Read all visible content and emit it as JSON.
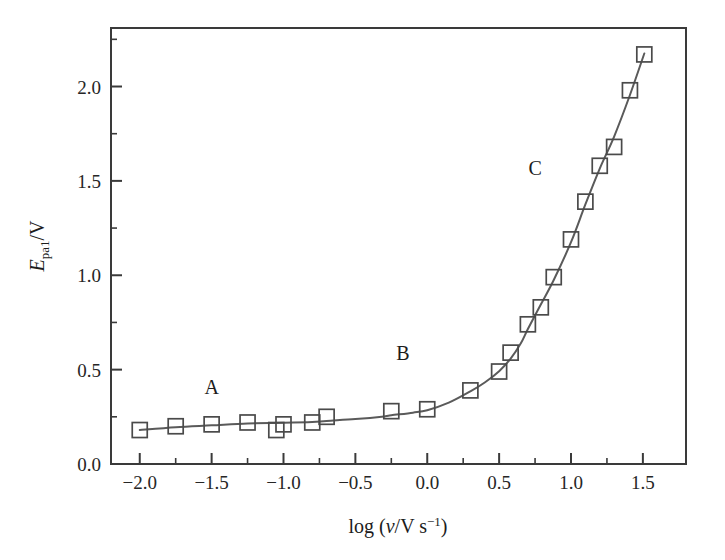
{
  "figure": {
    "background_color": "#ffffff",
    "frame_color": "#3a3a3a",
    "curve_color": "#5a5a5a",
    "marker_color": "#4a4a4a"
  },
  "axes": {
    "x": {
      "label_prefix": "log (",
      "label_symbol": "ν",
      "label_mid": "/V s",
      "label_exponent": "−1",
      "label_suffix": ")",
      "label_full": "log (ν/V s⁻¹)",
      "ticks": [
        "−2.0",
        "−1.5",
        "−1.0",
        "−0.5",
        "0.0",
        "0.5",
        "1.0",
        "1.5"
      ],
      "tick_values": [
        -2.0,
        -1.5,
        -1.0,
        -0.5,
        0.0,
        0.5,
        1.0,
        1.5
      ],
      "minor_tick_values": [
        -1.75,
        -1.25,
        -0.75,
        -0.25,
        0.25,
        0.75,
        1.25
      ],
      "range": [
        -2.2,
        1.8
      ]
    },
    "y": {
      "label_symbol": "E",
      "label_subscript": "pa1",
      "label_unit": "/V",
      "label_full": "Eₚₐ₁/V",
      "ticks": [
        "0.0",
        "0.5",
        "1.0",
        "1.5",
        "2.0"
      ],
      "tick_values": [
        0.0,
        0.5,
        1.0,
        1.5,
        2.0
      ],
      "minor_tick_values": [
        0.25,
        0.75,
        1.25,
        1.75,
        2.25
      ],
      "range": [
        0.0,
        2.31
      ]
    }
  },
  "annotations": [
    {
      "text": "A",
      "x": -1.5,
      "y": 0.37
    },
    {
      "text": "B",
      "x": -0.17,
      "y": 0.55
    },
    {
      "text": "C",
      "x": 0.75,
      "y": 1.53
    }
  ],
  "chart_data": {
    "type": "scatter",
    "title": "",
    "xlabel": "log (ν/V s⁻¹)",
    "ylabel": "E_pa1/V",
    "xlim": [
      -2.2,
      1.8
    ],
    "ylim": [
      0.0,
      2.31
    ],
    "grid": false,
    "legend": false,
    "marker_style": "open-square",
    "series": [
      {
        "name": "E_pa1",
        "x": [
          -2.0,
          -1.75,
          -1.5,
          -1.25,
          -1.05,
          -1.0,
          -0.8,
          -0.7,
          -0.25,
          0.0,
          0.3,
          0.5,
          0.58,
          0.7,
          0.79,
          0.88,
          1.0,
          1.1,
          1.2,
          1.3,
          1.41,
          1.51
        ],
        "y": [
          0.18,
          0.2,
          0.21,
          0.22,
          0.18,
          0.21,
          0.22,
          0.25,
          0.28,
          0.29,
          0.39,
          0.49,
          0.59,
          0.74,
          0.83,
          0.99,
          1.19,
          1.39,
          1.58,
          1.68,
          1.98,
          2.17
        ]
      }
    ],
    "fit_curve": {
      "name": "smooth trend line",
      "x": [
        -2.0,
        -1.75,
        -1.5,
        -1.25,
        -1.0,
        -0.8,
        -0.7,
        -0.5,
        -0.3,
        -0.25,
        -0.1,
        0.0,
        0.15,
        0.3,
        0.4,
        0.5,
        0.58,
        0.65,
        0.7,
        0.79,
        0.88,
        1.0,
        1.1,
        1.2,
        1.3,
        1.41,
        1.51
      ],
      "y": [
        0.18,
        0.195,
        0.205,
        0.215,
        0.218,
        0.222,
        0.228,
        0.238,
        0.252,
        0.258,
        0.272,
        0.285,
        0.325,
        0.385,
        0.432,
        0.492,
        0.558,
        0.638,
        0.715,
        0.845,
        0.975,
        1.175,
        1.375,
        1.565,
        1.735,
        1.955,
        2.175
      ]
    }
  }
}
